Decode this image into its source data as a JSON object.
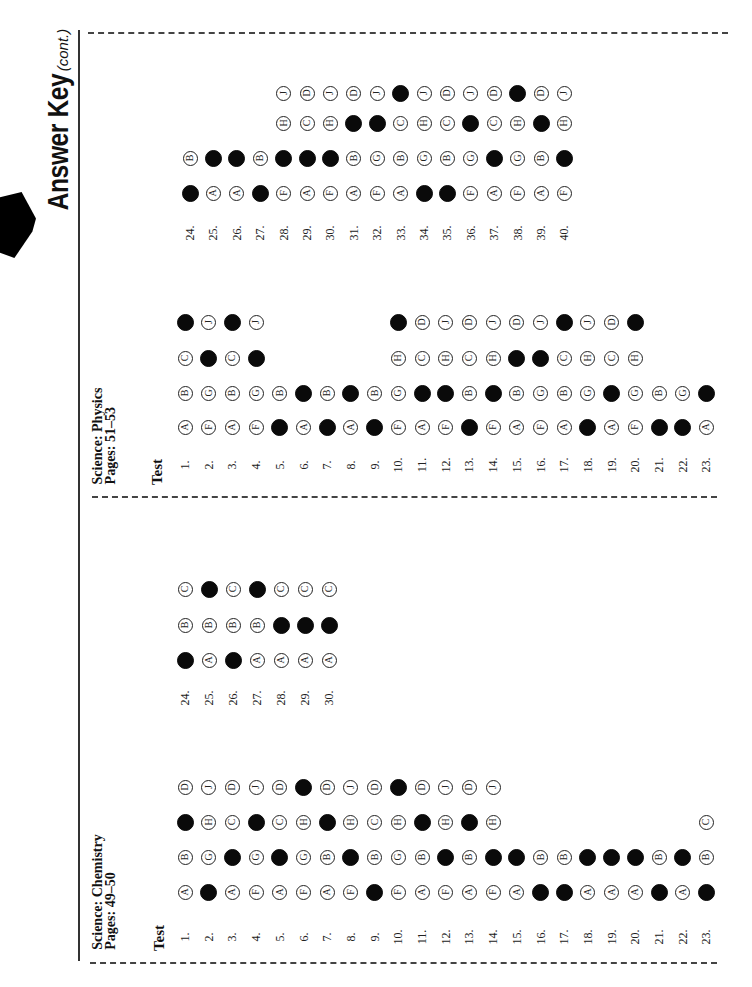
{
  "header": {
    "title": "Answer Key",
    "title_suffix": "(cont.)"
  },
  "sections": [
    {
      "id": "physics",
      "subject": "Science: Physics",
      "pages": "Pages: 51–53",
      "test_label": "Test",
      "groups": [
        {
          "start": 1,
          "answers": [
            {
              "q": 1,
              "choices": [
                "A",
                "B",
                "C",
                "D"
              ],
              "correct": "D"
            },
            {
              "q": 2,
              "choices": [
                "F",
                "G",
                "H",
                "J"
              ],
              "correct": "H"
            },
            {
              "q": 3,
              "choices": [
                "A",
                "B",
                "C",
                "D"
              ],
              "correct": "D"
            },
            {
              "q": 4,
              "choices": [
                "F",
                "G",
                "H",
                "J"
              ],
              "correct": "H"
            },
            {
              "q": 5,
              "choices": [
                "A",
                "B"
              ],
              "correct": "A"
            },
            {
              "q": 6,
              "choices": [
                "A",
                "B"
              ],
              "correct": "B"
            },
            {
              "q": 7,
              "choices": [
                "A",
                "B"
              ],
              "correct": "A"
            },
            {
              "q": 8,
              "choices": [
                "A",
                "B"
              ],
              "correct": "B"
            },
            {
              "q": 9,
              "choices": [
                "A",
                "B"
              ],
              "correct": "A"
            },
            {
              "q": 10,
              "choices": [
                "F",
                "G",
                "H",
                "J"
              ],
              "correct": "J"
            },
            {
              "q": 11,
              "choices": [
                "A",
                "B",
                "C",
                "D"
              ],
              "correct": "B"
            },
            {
              "q": 12,
              "choices": [
                "F",
                "G",
                "H",
                "J"
              ],
              "correct": "G"
            },
            {
              "q": 13,
              "choices": [
                "A",
                "B",
                "C",
                "D"
              ],
              "correct": "A"
            },
            {
              "q": 14,
              "choices": [
                "F",
                "G",
                "H",
                "J"
              ],
              "correct": "G"
            },
            {
              "q": 15,
              "choices": [
                "A",
                "B",
                "C",
                "D"
              ],
              "correct": "C"
            },
            {
              "q": 16,
              "choices": [
                "F",
                "G",
                "H",
                "J"
              ],
              "correct": "H"
            },
            {
              "q": 17,
              "choices": [
                "A",
                "B",
                "C",
                "D"
              ],
              "correct": "D"
            },
            {
              "q": 18,
              "choices": [
                "F",
                "G",
                "H",
                "J"
              ],
              "correct": "F"
            },
            {
              "q": 19,
              "choices": [
                "A",
                "B",
                "C",
                "D"
              ],
              "correct": "B"
            },
            {
              "q": 20,
              "choices": [
                "F",
                "G",
                "H",
                "J"
              ],
              "correct": "J"
            },
            {
              "q": 21,
              "choices": [
                "A",
                "B"
              ],
              "correct": "A"
            },
            {
              "q": 22,
              "choices": [
                "F",
                "G"
              ],
              "correct": "F"
            },
            {
              "q": 23,
              "choices": [
                "A",
                "B"
              ],
              "correct": "B"
            }
          ]
        },
        {
          "start": 24,
          "answers": [
            {
              "q": 24,
              "choices": [
                "A",
                "B"
              ],
              "correct": "A"
            },
            {
              "q": 25,
              "choices": [
                "A",
                "B"
              ],
              "correct": "B"
            },
            {
              "q": 26,
              "choices": [
                "A",
                "B"
              ],
              "correct": "B"
            },
            {
              "q": 27,
              "choices": [
                "A",
                "B"
              ],
              "correct": "A"
            },
            {
              "q": 28,
              "choices": [
                "F",
                "G",
                "H",
                "J"
              ],
              "correct": "G"
            },
            {
              "q": 29,
              "choices": [
                "A",
                "B",
                "C",
                "D"
              ],
              "correct": "B"
            },
            {
              "q": 30,
              "choices": [
                "F",
                "G",
                "H",
                "J"
              ],
              "correct": "G"
            },
            {
              "q": 31,
              "choices": [
                "A",
                "B",
                "C",
                "D"
              ],
              "correct": "C"
            },
            {
              "q": 32,
              "choices": [
                "F",
                "G",
                "H",
                "J"
              ],
              "correct": "H"
            },
            {
              "q": 33,
              "choices": [
                "A",
                "B",
                "C",
                "D"
              ],
              "correct": "D"
            },
            {
              "q": 34,
              "choices": [
                "F",
                "G",
                "H",
                "J"
              ],
              "correct": "F"
            },
            {
              "q": 35,
              "choices": [
                "A",
                "B",
                "C",
                "D"
              ],
              "correct": "A"
            },
            {
              "q": 36,
              "choices": [
                "F",
                "G",
                "H",
                "J"
              ],
              "correct": "H"
            },
            {
              "q": 37,
              "choices": [
                "A",
                "B",
                "C",
                "D"
              ],
              "correct": "B"
            },
            {
              "q": 38,
              "choices": [
                "F",
                "G",
                "H",
                "J"
              ],
              "correct": "J"
            },
            {
              "q": 39,
              "choices": [
                "A",
                "B",
                "C",
                "D"
              ],
              "correct": "C"
            },
            {
              "q": 40,
              "choices": [
                "F",
                "G",
                "H",
                "J"
              ],
              "correct": "G"
            }
          ]
        }
      ]
    },
    {
      "id": "chemistry",
      "subject": "Science: Chemistry",
      "pages": "Pages: 49–50",
      "test_label": "Test",
      "groups": [
        {
          "start": 1,
          "answers": [
            {
              "q": 1,
              "choices": [
                "A",
                "B",
                "C",
                "D"
              ],
              "correct": "C"
            },
            {
              "q": 2,
              "choices": [
                "F",
                "G",
                "H",
                "J"
              ],
              "correct": "F"
            },
            {
              "q": 3,
              "choices": [
                "A",
                "B",
                "C",
                "D"
              ],
              "correct": "B"
            },
            {
              "q": 4,
              "choices": [
                "F",
                "G",
                "H",
                "J"
              ],
              "correct": "H"
            },
            {
              "q": 5,
              "choices": [
                "A",
                "B",
                "C",
                "D"
              ],
              "correct": "B"
            },
            {
              "q": 6,
              "choices": [
                "F",
                "G",
                "H",
                "J"
              ],
              "correct": "J"
            },
            {
              "q": 7,
              "choices": [
                "A",
                "B",
                "C",
                "D"
              ],
              "correct": "C"
            },
            {
              "q": 8,
              "choices": [
                "F",
                "G",
                "H",
                "J"
              ],
              "correct": "G"
            },
            {
              "q": 9,
              "choices": [
                "A",
                "B",
                "C",
                "D"
              ],
              "correct": "A"
            },
            {
              "q": 10,
              "choices": [
                "F",
                "G",
                "H",
                "J"
              ],
              "correct": "J"
            },
            {
              "q": 11,
              "choices": [
                "A",
                "B",
                "C",
                "D"
              ],
              "correct": "C"
            },
            {
              "q": 12,
              "choices": [
                "F",
                "G",
                "H",
                "J"
              ],
              "correct": "G"
            },
            {
              "q": 13,
              "choices": [
                "A",
                "B",
                "C",
                "D"
              ],
              "correct": "C"
            },
            {
              "q": 14,
              "choices": [
                "F",
                "G",
                "H",
                "J"
              ],
              "correct": "G"
            },
            {
              "q": 15,
              "choices": [
                "A",
                "B"
              ],
              "correct": "B"
            },
            {
              "q": 16,
              "choices": [
                "A",
                "B"
              ],
              "correct": "A"
            },
            {
              "q": 17,
              "choices": [
                "A",
                "B"
              ],
              "correct": "A"
            },
            {
              "q": 18,
              "choices": [
                "A",
                "B"
              ],
              "correct": "B"
            },
            {
              "q": 19,
              "choices": [
                "A",
                "B"
              ],
              "correct": "B"
            },
            {
              "q": 20,
              "choices": [
                "A",
                "B"
              ],
              "correct": "B"
            },
            {
              "q": 21,
              "choices": [
                "A",
                "B"
              ],
              "correct": "A"
            },
            {
              "q": 22,
              "choices": [
                "A",
                "B"
              ],
              "correct": "B"
            },
            {
              "q": 23,
              "choices": [
                "A",
                "B",
                "C"
              ],
              "correct": "A"
            }
          ]
        },
        {
          "start": 24,
          "answers": [
            {
              "q": 24,
              "choices": [
                "A",
                "B",
                "C"
              ],
              "correct": "A"
            },
            {
              "q": 25,
              "choices": [
                "A",
                "B",
                "C"
              ],
              "correct": "C"
            },
            {
              "q": 26,
              "choices": [
                "A",
                "B",
                "C"
              ],
              "correct": "A"
            },
            {
              "q": 27,
              "choices": [
                "A",
                "B",
                "C"
              ],
              "correct": "C"
            },
            {
              "q": 28,
              "choices": [
                "A",
                "B",
                "C"
              ],
              "correct": "B"
            },
            {
              "q": 29,
              "choices": [
                "A",
                "B",
                "C"
              ],
              "correct": "B"
            },
            {
              "q": 30,
              "choices": [
                "A",
                "B",
                "C"
              ],
              "correct": "B"
            }
          ]
        }
      ]
    }
  ]
}
